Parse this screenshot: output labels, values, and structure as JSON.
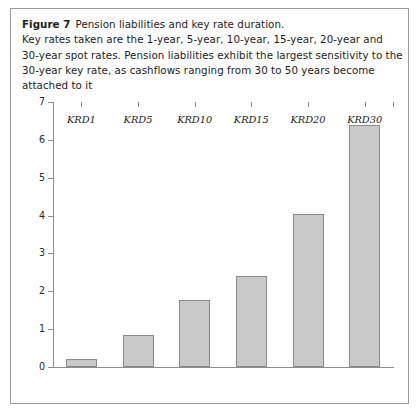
{
  "figure": {
    "label": "Figure 7",
    "title": "Pension liabilities and key rate duration.",
    "caption_line2": "Key rates taken are the 1-year, 5-year, 10-year, 15-year, 20-year and",
    "caption_line3": "30-year spot rates. Pension liabilities exhibit the largest sensitivity to the",
    "caption_line4": "30-year key rate, as cashflows ranging from 30 to 50 years become",
    "caption_line5": "attached to it",
    "frame_border_color": "#9a9a9a"
  },
  "chart_data": {
    "type": "bar",
    "title": "Pension liabilities and key rate duration.",
    "xlabel": "",
    "ylabel": "",
    "categories": [
      "KRD1",
      "KRD5",
      "KRD10",
      "KRD15",
      "KRD20",
      "KRD30"
    ],
    "values": [
      0.2,
      0.85,
      1.78,
      2.4,
      4.05,
      6.4
    ],
    "ylim": [
      0,
      7
    ],
    "yticks": [
      0,
      1,
      2,
      3,
      4,
      5,
      6,
      7
    ],
    "ytick_labels": [
      "0",
      "1",
      "2",
      "3",
      "4",
      "5",
      "6",
      "7"
    ],
    "grid": false,
    "legend": null,
    "bar_fill_color": "#c9c9c9",
    "bar_border_color": "#8a8a8a",
    "axis_color": "#8d8d8d"
  }
}
